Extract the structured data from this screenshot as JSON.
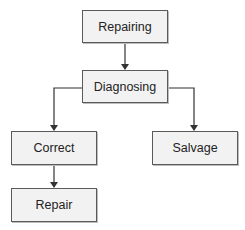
{
  "diagram": {
    "type": "hierarchy-flowchart",
    "nodes": [
      {
        "id": "repairing",
        "label": "Repairing"
      },
      {
        "id": "diagnosing",
        "label": "Diagnosing"
      },
      {
        "id": "correct",
        "label": "Correct"
      },
      {
        "id": "salvage",
        "label": "Salvage"
      },
      {
        "id": "repair",
        "label": "Repair"
      }
    ],
    "edges": [
      {
        "from": "repairing",
        "to": "diagnosing"
      },
      {
        "from": "diagnosing",
        "to": "correct"
      },
      {
        "from": "diagnosing",
        "to": "salvage"
      },
      {
        "from": "correct",
        "to": "repair"
      }
    ],
    "colors": {
      "box_fill": "#f2f2f2",
      "box_border": "#5a5a5a",
      "line": "#333333"
    }
  }
}
